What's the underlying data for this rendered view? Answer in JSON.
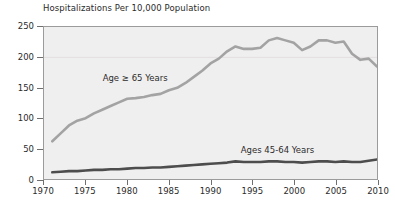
{
  "chart_data": {
    "type": "line",
    "title": "Hospitalizations Per 10,000 Population",
    "xlabel": "",
    "ylabel": "",
    "xlim": [
      1970,
      2010
    ],
    "ylim": [
      0,
      250
    ],
    "grid": true,
    "gridlines_y": [
      200
    ],
    "legend_position": "inline-annotation",
    "xticks": [
      1970,
      1975,
      1980,
      1985,
      1990,
      1995,
      2000,
      2005,
      2010
    ],
    "yticks": [
      0,
      50,
      100,
      150,
      200,
      250
    ],
    "x": [
      1971,
      1972,
      1973,
      1974,
      1975,
      1976,
      1977,
      1978,
      1979,
      1980,
      1981,
      1982,
      1983,
      1984,
      1985,
      1986,
      1987,
      1988,
      1989,
      1990,
      1991,
      1992,
      1993,
      1994,
      1995,
      1996,
      1997,
      1998,
      1999,
      2000,
      2001,
      2002,
      2003,
      2004,
      2005,
      2006,
      2007,
      2008,
      2009,
      2010
    ],
    "series": [
      {
        "name": "Age ≥ 65 Years",
        "color": "#a3a3a3",
        "label_x": 1981,
        "label_y": 165,
        "values": [
          62,
          75,
          88,
          96,
          100,
          108,
          114,
          120,
          126,
          132,
          133,
          135,
          138,
          140,
          146,
          150,
          158,
          168,
          178,
          190,
          198,
          210,
          218,
          214,
          214,
          216,
          228,
          232,
          228,
          224,
          212,
          218,
          228,
          228,
          224,
          226,
          206,
          196,
          198,
          185
        ]
      },
      {
        "name": "Ages 45-64 Years",
        "color": "#4d4d4d",
        "label_x": 1998,
        "label_y": 48,
        "values": [
          11,
          12,
          13,
          13,
          14,
          15,
          15,
          16,
          16,
          17,
          18,
          18,
          19,
          19,
          20,
          21,
          22,
          23,
          24,
          25,
          26,
          27,
          29,
          28,
          28,
          28,
          29,
          29,
          28,
          28,
          27,
          28,
          29,
          29,
          28,
          29,
          28,
          28,
          30,
          32
        ]
      }
    ]
  }
}
